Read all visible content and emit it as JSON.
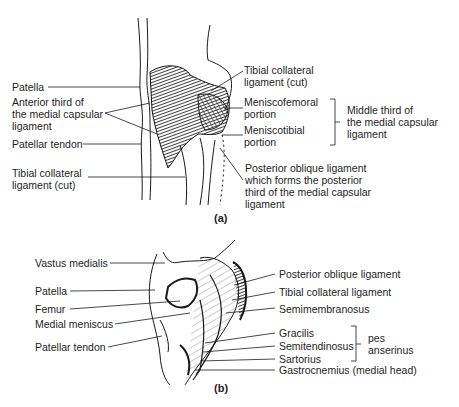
{
  "figure_a": {
    "caption": "(a)",
    "labels_left": {
      "patella": "Patella",
      "anterior_third": "Anterior third of\nthe medial capsular\nligament",
      "patellar_tendon": "Patellar tendon",
      "tibial_collateral_cut": "Tibial collateral\nligament (cut)"
    },
    "labels_right": {
      "tibial_collateral_cut": "Tibial collateral\nligament (cut)",
      "meniscofemoral": "Meniscofemoral\nportion",
      "meniscotibial": "Meniscotibial\nportion",
      "middle_third": "Middle third of\nthe medial capsular\nligament",
      "posterior_oblique": "Posterior oblique ligament\nwhich forms the posterior\nthird of the medial capsular\nligament"
    }
  },
  "figure_b": {
    "caption": "(b)",
    "labels_left": {
      "vastus_medialis": "Vastus medialis",
      "patella": "Patella",
      "femur": "Femur",
      "medial_meniscus": "Medial meniscus",
      "patellar_tendon": "Patellar tendon"
    },
    "labels_right": {
      "posterior_oblique": "Posterior oblique ligament",
      "tibial_collateral": "Tibial collateral ligament",
      "semimembranosus": "Semimembranosus",
      "gracilis": "Gracilis",
      "semitendinosus": "Semitendinosus",
      "sartorius": "Sartorius",
      "pes_anserinus": "pes\nanserinus",
      "gastrocnemius": "Gastrocnemius (medial head)"
    }
  }
}
